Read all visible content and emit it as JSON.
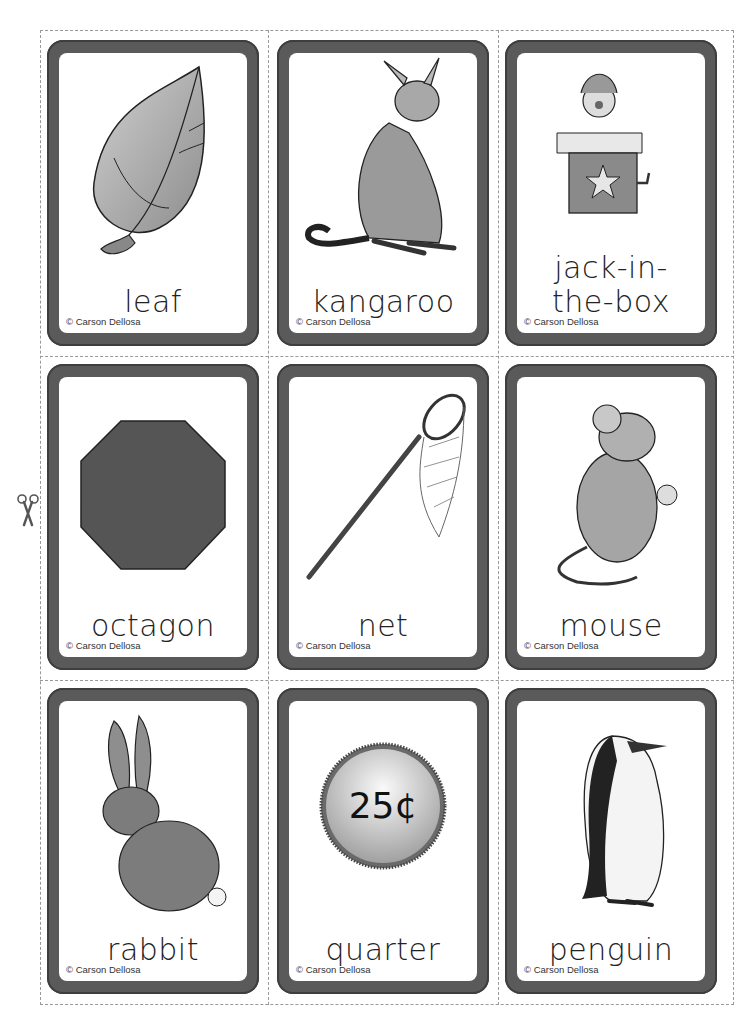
{
  "sheet": {
    "copyright": "© Carson Dellosa",
    "cut_icon": "scissors-icon"
  },
  "cards": [
    {
      "word": "leaf",
      "picture": "leaf-icon"
    },
    {
      "word": "kangaroo",
      "picture": "kangaroo-icon"
    },
    {
      "word_line1": "jack-in-",
      "word_line2": "the-box",
      "picture": "jack-in-the-box-icon"
    },
    {
      "word": "octagon",
      "picture": "octagon-icon"
    },
    {
      "word": "net",
      "picture": "net-icon"
    },
    {
      "word": "mouse",
      "picture": "mouse-icon"
    },
    {
      "word": "rabbit",
      "picture": "rabbit-icon"
    },
    {
      "word": "quarter",
      "picture": "quarter-coin-icon",
      "coin_label": "25¢"
    },
    {
      "word": "penguin",
      "picture": "penguin-icon"
    }
  ],
  "colors": {
    "frame": "#5a5a5a",
    "card_face": "#ffffff",
    "cut_line": "#999999"
  }
}
